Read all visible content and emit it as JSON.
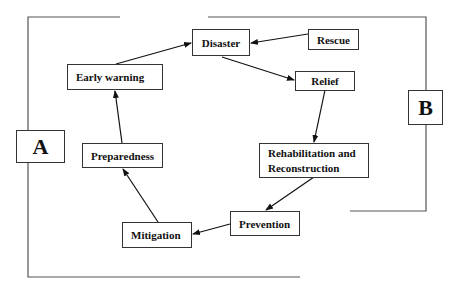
{
  "diagram": {
    "type": "disaster-management-cycle",
    "nodes": {
      "disaster": "Disaster",
      "rescue": "Rescue",
      "relief": "Relief",
      "rehab_line1": "Rehabilitation and",
      "rehab_line2": "Reconstruction",
      "prevention": "Prevention",
      "mitigation": "Mitigation",
      "preparedness": "Preparedness",
      "early_warning": "Early warning"
    },
    "groups": {
      "a": "A",
      "b": "B"
    },
    "edges": [
      {
        "from": "Rescue",
        "to": "Disaster"
      },
      {
        "from": "Disaster",
        "to": "Relief"
      },
      {
        "from": "Relief",
        "to": "Rehabilitation and Reconstruction"
      },
      {
        "from": "Rehabilitation and Reconstruction",
        "to": "Prevention"
      },
      {
        "from": "Prevention",
        "to": "Mitigation"
      },
      {
        "from": "Mitigation",
        "to": "Preparedness"
      },
      {
        "from": "Preparedness",
        "to": "Early warning"
      },
      {
        "from": "Early warning",
        "to": "Disaster"
      }
    ],
    "colors": {
      "line": "#333333",
      "background": "#ffffff",
      "text": "#111111"
    }
  }
}
